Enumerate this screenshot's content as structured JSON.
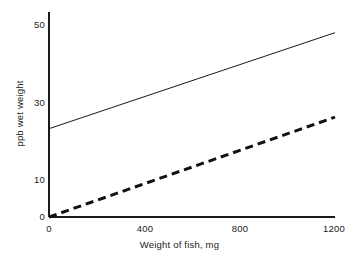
{
  "chart_data": {
    "type": "line",
    "title": "",
    "subtitle": "",
    "xlabel": "Weight of fish, mg",
    "ylabel": "ppb wet weight",
    "xlim": [
      0,
      1200
    ],
    "ylim": [
      0,
      50
    ],
    "xticks": [
      "0",
      "400",
      "800",
      "1200"
    ],
    "xtick_values": [
      0,
      400,
      800,
      1200
    ],
    "yticks": [
      "0",
      "10",
      "30",
      "50"
    ],
    "ytick_values": [
      0,
      10,
      30,
      50
    ],
    "grid": false,
    "legend": "none",
    "annotations": [],
    "series": [
      {
        "name": "solid-line",
        "style": "solid",
        "color": "#1a1a1a",
        "line_width": 1,
        "x": [
          0,
          1200
        ],
        "values": [
          23,
          48
        ],
        "intercept": 23,
        "slope_per_mg": 0.0208
      },
      {
        "name": "dashed-line",
        "style": "dashed",
        "color": "#111111",
        "line_width": 3,
        "x": [
          0,
          1200
        ],
        "values": [
          0,
          26
        ],
        "intercept": 0,
        "slope_per_mg": 0.0217
      }
    ]
  },
  "axes": {
    "x_title": "Weight of fish, mg",
    "y_title": "ppb wet weight",
    "x_tick_labels": [
      "0",
      "400",
      "800",
      "1200"
    ],
    "y_tick_labels": [
      "0",
      "10",
      "30",
      "50"
    ],
    "axis_color": "#1a1a1a"
  },
  "colors": {
    "background": "#ffffff",
    "axis": "#1a1a1a",
    "solid_series": "#1a1a1a",
    "dashed_series": "#111111",
    "text": "#1c1c1c"
  }
}
